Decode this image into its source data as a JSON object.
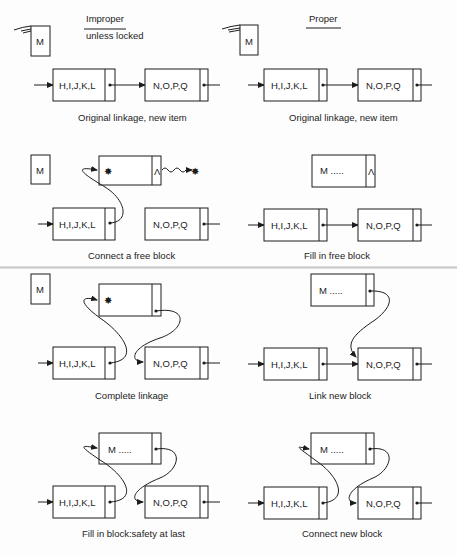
{
  "headings": {
    "left": {
      "line1": "Improper",
      "line2": "unless locked"
    },
    "right": {
      "line1": "Proper"
    }
  },
  "nodes": {
    "first": "H,I,J,K,L",
    "second": "N,O,P,Q",
    "new_item": "M",
    "filled": "M  .....",
    "null_pointer": "Λ",
    "garbage": "✸"
  },
  "panels": [
    {
      "id": "left-1",
      "caption": "Original linkage, new item"
    },
    {
      "id": "right-1",
      "caption": "Original linkage, new item"
    },
    {
      "id": "left-2",
      "caption": "Connect a free block"
    },
    {
      "id": "right-2",
      "caption": "Fill in free block"
    },
    {
      "id": "left-3",
      "caption": "Complete linkage"
    },
    {
      "id": "right-3",
      "caption": "Link new block"
    },
    {
      "id": "left-4",
      "caption": "Fill in block:safety at last"
    },
    {
      "id": "right-4",
      "caption": "Connect new block"
    }
  ],
  "colors": {
    "ink": "#1c1c1c",
    "paper": "#fdfdfd",
    "seam": "#c9c9c9"
  }
}
